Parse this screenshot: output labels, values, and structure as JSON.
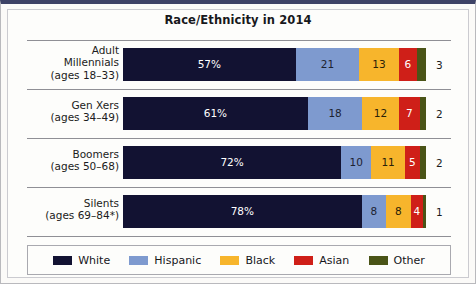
{
  "figure": {
    "title": "Race/Ethnicity in 2014",
    "border_color": "#3d4266",
    "background": "#fdfdfb"
  },
  "chart_data": {
    "type": "bar",
    "subtype": "stacked-horizontal-100",
    "title": "Race/Ethnicity in 2014",
    "xlabel": "",
    "ylabel": "",
    "xlim": [
      0,
      100
    ],
    "grid": false,
    "legend_position": "bottom",
    "value_suffix_first_series": "%",
    "categories": [
      "Adult Millennials (ages 18–33)",
      "Gen Xers (ages 34–49)",
      "Boomers (ages 50–68)",
      "Silents (ages 69–84*)"
    ],
    "series": [
      {
        "name": "White",
        "color": "#121232",
        "values": [
          57,
          61,
          72,
          78
        ]
      },
      {
        "name": "Hispanic",
        "color": "#7e9acf",
        "values": [
          21,
          18,
          10,
          8
        ]
      },
      {
        "name": "Black",
        "color": "#f7b52c",
        "values": [
          13,
          12,
          11,
          8
        ]
      },
      {
        "name": "Asian",
        "color": "#cf1f18",
        "values": [
          6,
          7,
          5,
          4
        ]
      },
      {
        "name": "Other",
        "color": "#4a5417",
        "values": [
          3,
          2,
          2,
          1
        ]
      }
    ]
  },
  "rows": [
    {
      "label_lines": [
        "Adult",
        "Millennials",
        "(ages 18–33)"
      ],
      "segments": [
        {
          "series": "White",
          "value": 57,
          "display": "57%",
          "color": "#121232",
          "inside": true
        },
        {
          "series": "Hispanic",
          "value": 21,
          "display": "21",
          "color": "#7e9acf",
          "inside": true
        },
        {
          "series": "Black",
          "value": 13,
          "display": "13",
          "color": "#f7b52c",
          "inside": true
        },
        {
          "series": "Asian",
          "value": 6,
          "display": "6",
          "color": "#cf1f18",
          "inside": true
        },
        {
          "series": "Other",
          "value": 3,
          "display": "3",
          "color": "#4a5417",
          "inside": false
        }
      ]
    },
    {
      "label_lines": [
        "Gen Xers",
        "(ages 34–49)"
      ],
      "segments": [
        {
          "series": "White",
          "value": 61,
          "display": "61%",
          "color": "#121232",
          "inside": true
        },
        {
          "series": "Hispanic",
          "value": 18,
          "display": "18",
          "color": "#7e9acf",
          "inside": true
        },
        {
          "series": "Black",
          "value": 12,
          "display": "12",
          "color": "#f7b52c",
          "inside": true
        },
        {
          "series": "Asian",
          "value": 7,
          "display": "7",
          "color": "#cf1f18",
          "inside": true
        },
        {
          "series": "Other",
          "value": 2,
          "display": "2",
          "color": "#4a5417",
          "inside": false
        }
      ]
    },
    {
      "label_lines": [
        "Boomers",
        "(ages 50–68)"
      ],
      "segments": [
        {
          "series": "White",
          "value": 72,
          "display": "72%",
          "color": "#121232",
          "inside": true
        },
        {
          "series": "Hispanic",
          "value": 10,
          "display": "10",
          "color": "#7e9acf",
          "inside": true
        },
        {
          "series": "Black",
          "value": 11,
          "display": "11",
          "color": "#f7b52c",
          "inside": true
        },
        {
          "series": "Asian",
          "value": 5,
          "display": "5",
          "color": "#cf1f18",
          "inside": true
        },
        {
          "series": "Other",
          "value": 2,
          "display": "2",
          "color": "#4a5417",
          "inside": false
        }
      ]
    },
    {
      "label_lines": [
        "Silents",
        "(ages 69–84*)"
      ],
      "segments": [
        {
          "series": "White",
          "value": 78,
          "display": "78%",
          "color": "#121232",
          "inside": true
        },
        {
          "series": "Hispanic",
          "value": 8,
          "display": "8",
          "color": "#7e9acf",
          "inside": true
        },
        {
          "series": "Black",
          "value": 8,
          "display": "8",
          "color": "#f7b52c",
          "inside": true
        },
        {
          "series": "Asian",
          "value": 4,
          "display": "4",
          "color": "#cf1f18",
          "inside": true
        },
        {
          "series": "Other",
          "value": 1,
          "display": "1",
          "color": "#4a5417",
          "inside": false
        }
      ]
    }
  ],
  "legend": {
    "items": [
      {
        "label": "White",
        "color": "#121232"
      },
      {
        "label": "Hispanic",
        "color": "#7e9acf"
      },
      {
        "label": "Black",
        "color": "#f7b52c"
      },
      {
        "label": "Asian",
        "color": "#cf1f18"
      },
      {
        "label": "Other",
        "color": "#4a5417"
      }
    ]
  }
}
